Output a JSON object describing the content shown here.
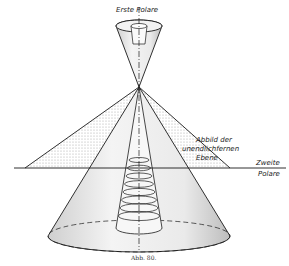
{
  "figure": {
    "caption": "Abb. 80.",
    "labels": {
      "first_polar": "Erste Polare",
      "second_polar_line1": "Zweite",
      "second_polar_line2": "Polare",
      "image_line1": "Abbild der",
      "image_line2": "unendlichfernen",
      "image_line3": "Ebene"
    },
    "colors": {
      "ink": "#1a1a1a",
      "shade": "#d8d8d8",
      "background": "#ffffff"
    }
  }
}
